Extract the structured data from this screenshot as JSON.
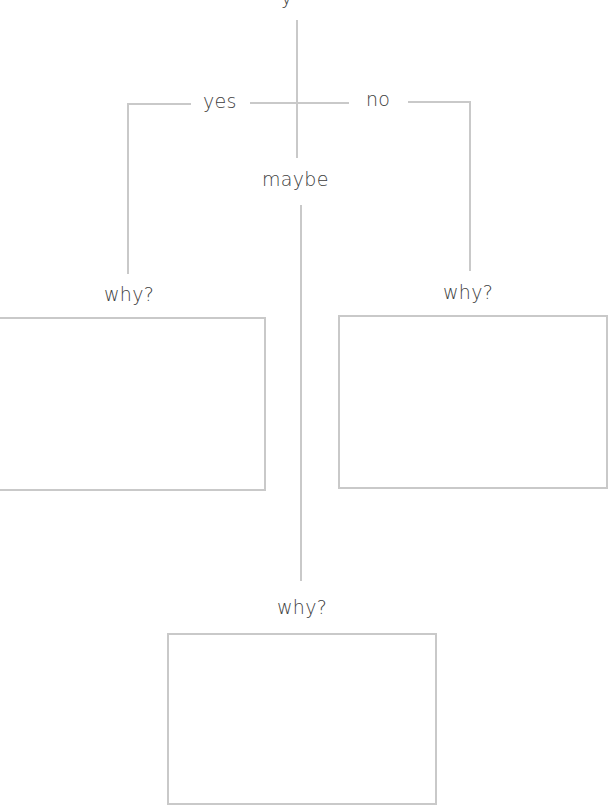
{
  "diagram": {
    "top_label_fragment": "y",
    "branches": {
      "yes": "yes",
      "no": "no",
      "maybe": "maybe"
    },
    "prompts": {
      "left": "why?",
      "right": "why?",
      "bottom": "why?"
    },
    "colors": {
      "line": "#c9c9c9",
      "text": "#3d3d3d",
      "background": "#ffffff"
    }
  }
}
